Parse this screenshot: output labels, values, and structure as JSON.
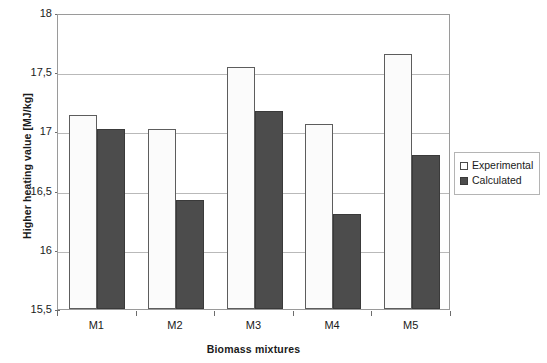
{
  "chart_data": {
    "type": "bar",
    "title": "",
    "xlabel": "Biomass mixtures",
    "ylabel": "Higher heating value [MJ/kg]",
    "categories": [
      "M1",
      "M2",
      "M3",
      "M4",
      "M5"
    ],
    "series": [
      {
        "name": "Experimental",
        "values": [
          17.14,
          17.02,
          17.54,
          17.06,
          17.65
        ],
        "color": "#fbfbfb"
      },
      {
        "name": "Calculated",
        "values": [
          17.02,
          16.42,
          17.17,
          16.3,
          16.8
        ],
        "color": "#4c4c4c"
      }
    ],
    "ylim": [
      15.5,
      18.0
    ],
    "y_ticks": [
      15.5,
      16.0,
      16.5,
      17.0,
      17.5,
      18.0
    ],
    "y_tick_labels": [
      "15,5",
      "16",
      "16,5",
      "17",
      "17,5",
      "18"
    ],
    "grid": true,
    "legend_position": "right",
    "decimal_separator": ","
  },
  "legend": {
    "items": [
      {
        "label": "Experimental",
        "swatch": "experimental"
      },
      {
        "label": "Calculated",
        "swatch": "calculated"
      }
    ]
  }
}
